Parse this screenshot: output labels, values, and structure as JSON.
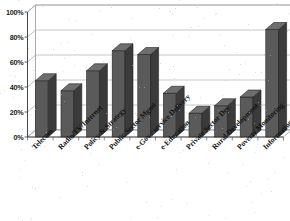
{
  "chart_data": {
    "type": "bar",
    "title": "",
    "xlabel": "",
    "ylabel": "",
    "ylim": [
      0,
      100
    ],
    "ytick_labels": [
      "0%",
      "20%",
      "40%",
      "60%",
      "80%",
      "100%"
    ],
    "ytick_values": [
      0,
      20,
      40,
      60,
      80,
      100
    ],
    "grid": true,
    "legend": "none",
    "style": "3d-column",
    "bar_color": "#5a5a5a",
    "bar_side_color": "#3b3b3b",
    "bar_top_color": "#6e6e6e",
    "plot_bg_color": "#ffffff",
    "gridline_color": "#b0b0b0",
    "categories": [
      "Telecom",
      "Radio/TV/Internet",
      "Policy & Strategy",
      "Public Sector Mgmt",
      "e-Gov / service Delivery",
      "e-Education",
      "Private Sector Dev.",
      "Rural Development",
      "Poverty Monitoring",
      "Information Technology"
    ],
    "values": [
      45,
      37,
      53,
      69,
      66,
      35,
      19,
      25,
      32,
      86
    ]
  }
}
